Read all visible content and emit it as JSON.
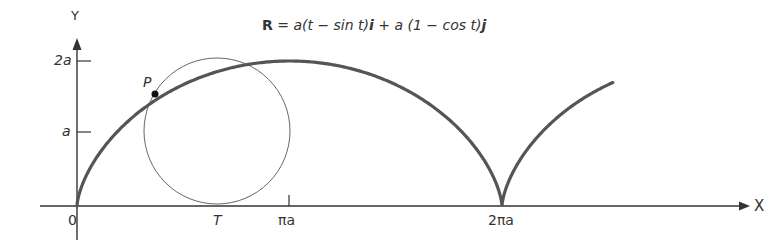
{
  "equation": {
    "lhs": "R",
    "rest": " = a(t − sin t)",
    "i": "i",
    "plus": " + a (1 − cos t)",
    "j": "j"
  },
  "axes": {
    "x_label": "X",
    "y_label": "Y",
    "origin_label": "0",
    "y_ticks": [
      "2a",
      "a"
    ],
    "x_ticks": [
      "πa",
      "2πa"
    ]
  },
  "points": {
    "P": "P",
    "T": "T"
  },
  "colors": {
    "curve": "#555555",
    "axes": "#333333",
    "circle": "#666666"
  }
}
